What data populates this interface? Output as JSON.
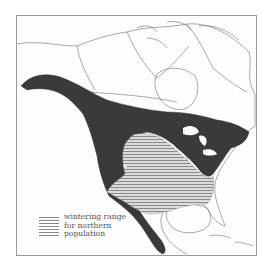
{
  "map": {
    "region": "North America",
    "style": "grayscale range map",
    "colors": {
      "background": "#fdfdfd",
      "frame": "#9a9a9a",
      "range_fill": "#3a3a3a",
      "wintering_hatch": "#8a8a8a",
      "borders": "#6f6f6f"
    },
    "layers": [
      {
        "name": "breeding/year-round range",
        "fill": "solid dark"
      },
      {
        "name": "wintering range for northern population",
        "fill": "horizontal hatching"
      }
    ]
  },
  "legend": {
    "entries": [
      {
        "swatch": "horizontal-hatch",
        "label_lines": [
          "wintering range",
          "for northern",
          "population"
        ]
      }
    ]
  }
}
